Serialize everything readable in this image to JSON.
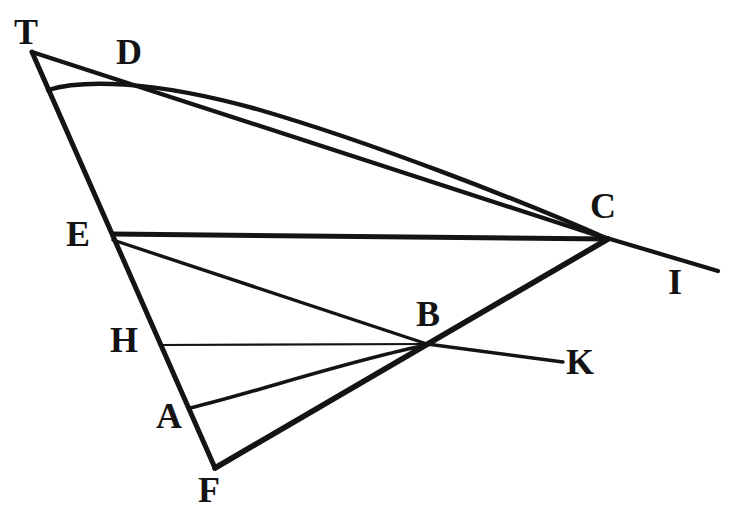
{
  "figure": {
    "background_color": "#ffffff",
    "stroke_color": "#141414",
    "width": 735,
    "height": 531,
    "labels": [
      {
        "id": "T",
        "text": "T",
        "x": 14,
        "y": 14,
        "font_size": 36
      },
      {
        "id": "D",
        "text": "D",
        "x": 116,
        "y": 34,
        "font_size": 36
      },
      {
        "id": "C",
        "text": "C",
        "x": 590,
        "y": 188,
        "font_size": 36
      },
      {
        "id": "E",
        "text": "E",
        "x": 66,
        "y": 216,
        "font_size": 36
      },
      {
        "id": "I",
        "text": "I",
        "x": 668,
        "y": 264,
        "font_size": 36
      },
      {
        "id": "B",
        "text": "B",
        "x": 416,
        "y": 296,
        "font_size": 36
      },
      {
        "id": "H",
        "text": "H",
        "x": 110,
        "y": 322,
        "font_size": 36
      },
      {
        "id": "K",
        "text": "K",
        "x": 566,
        "y": 344,
        "font_size": 36
      },
      {
        "id": "A",
        "text": "A",
        "x": 156,
        "y": 398,
        "font_size": 36
      },
      {
        "id": "F",
        "text": "F",
        "x": 198,
        "y": 472,
        "font_size": 36
      }
    ],
    "points": [
      {
        "id": "T",
        "x": 32,
        "y": 52
      },
      {
        "id": "D",
        "x": 121,
        "y": 82
      },
      {
        "id": "E",
        "x": 113,
        "y": 234
      },
      {
        "id": "H",
        "x": 160,
        "y": 345
      },
      {
        "id": "A",
        "x": 190,
        "y": 408
      },
      {
        "id": "F",
        "x": 215,
        "y": 468
      },
      {
        "id": "B",
        "x": 427,
        "y": 344
      },
      {
        "id": "C",
        "x": 608,
        "y": 239
      },
      {
        "id": "K",
        "x": 563,
        "y": 362
      },
      {
        "id": "I",
        "x": 718,
        "y": 271
      }
    ],
    "segments": [
      {
        "id": "T-F",
        "from": "T",
        "to": "F",
        "path": "M 32 52 L 215 468",
        "width": 5.0
      },
      {
        "id": "T-C",
        "from": "T",
        "to": "C",
        "path": "M 32 52 L 608 239",
        "width": 4.2
      },
      {
        "id": "E-C",
        "from": "E",
        "to": "C",
        "path": "M 113 234 L 608 239",
        "width": 5.0
      },
      {
        "id": "E-B",
        "from": "E",
        "to": "B",
        "path": "M 113 240 L 427 344",
        "width": 3.4
      },
      {
        "id": "H-B",
        "from": "H",
        "to": "B",
        "path": "M 160 345 L 427 344",
        "width": 2.2
      },
      {
        "id": "F-C",
        "from": "F",
        "to": "C",
        "path": "M 215 468 L 608 239",
        "width": 5.6
      },
      {
        "id": "B-K",
        "from": "B",
        "to": "K",
        "path": "M 427 344 L 563 362",
        "width": 3.4
      },
      {
        "id": "C-I",
        "from": "C",
        "to": "I",
        "path": "M 600 236 L 718 271",
        "width": 4.2
      }
    ],
    "curves": [
      {
        "id": "curve-TDC",
        "from": "T-line",
        "through": "D",
        "to": "C",
        "path": "M 48 90 C 80 80, 150 79, 260 110 C 370 142, 520 200, 608 239",
        "width": 4.4
      },
      {
        "id": "curve-AB",
        "from": "A",
        "to": "B",
        "path": "M 190 408 C 250 394, 350 360, 427 345",
        "width": 3.6
      }
    ]
  }
}
